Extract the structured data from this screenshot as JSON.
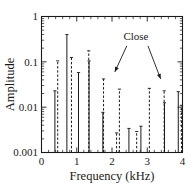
{
  "chart_data": {
    "type": "bar",
    "title": "",
    "subtitle": "",
    "xlabel": "Frequency (kHz)",
    "ylabel": "Amplitude",
    "xlim": [
      0,
      4
    ],
    "ylim": [
      0.001,
      1
    ],
    "yscale": "log",
    "xscale": "linear",
    "grid": false,
    "legend": null,
    "xticks": [
      0,
      1,
      2,
      3,
      4
    ],
    "xticklabels": [
      "0",
      "1",
      "2",
      "3",
      "4"
    ],
    "yticks": [
      0.001,
      0.01,
      0.1,
      1
    ],
    "yticklabels": [
      "0.001",
      "0.01",
      "0.1",
      "1"
    ],
    "series": [
      {
        "name": "solid",
        "style": "solid",
        "x": [
          0.38,
          0.72,
          1.05,
          1.35,
          1.74,
          2.48,
          2.82,
          3.49,
          3.88
        ],
        "values": [
          0.023,
          0.4,
          0.058,
          0.105,
          0.0077,
          0.0034,
          0.0038,
          0.0125,
          0.022
        ]
      },
      {
        "name": "dashed",
        "style": "dashed",
        "x": [
          0.46,
          0.85,
          1.34,
          1.76,
          2.13,
          2.21,
          2.7,
          3.06,
          3.48,
          3.97
        ],
        "values": [
          0.105,
          0.125,
          0.175,
          0.042,
          0.0027,
          0.025,
          0.0029,
          0.026,
          0.023,
          0.011
        ]
      }
    ],
    "annotations": [
      {
        "text": "Close",
        "x": 2.68,
        "y": 0.3,
        "arrows": [
          {
            "from_x": 2.42,
            "from_y": 0.225,
            "to_x": 2.08,
            "to_y": 0.06
          },
          {
            "from_x": 3.02,
            "from_y": 0.225,
            "to_x": 3.38,
            "to_y": 0.042
          }
        ]
      }
    ]
  }
}
